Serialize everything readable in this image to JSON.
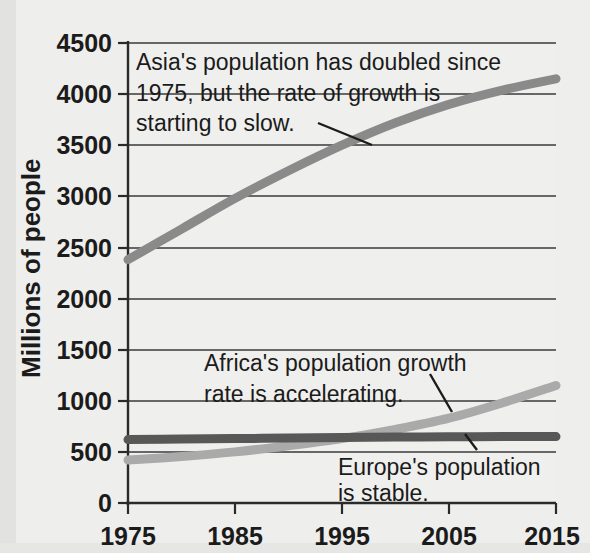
{
  "chart_data": {
    "type": "line",
    "title": "",
    "subtitle": "",
    "xlabel": "",
    "ylabel": "Millions of people",
    "x": [
      1975,
      1980,
      1985,
      1990,
      1995,
      2000,
      2005,
      2010,
      2015
    ],
    "xlim": [
      1975,
      2015
    ],
    "ylim": [
      0,
      4500
    ],
    "grid": true,
    "legend_position": "none",
    "x_tick_labels": [
      "1975",
      "1985",
      "1995",
      "2005",
      "2015"
    ],
    "x_tick_values": [
      1975,
      1985,
      1995,
      2005,
      2015
    ],
    "y_tick_labels": [
      "0",
      "500",
      "1000",
      "1500",
      "2000",
      "2500",
      "3000",
      "3500",
      "4000",
      "4500"
    ],
    "y_tick_values": [
      0,
      500,
      1000,
      1500,
      2000,
      2500,
      3000,
      3500,
      4000,
      4500
    ],
    "series": [
      {
        "name": "Asia",
        "color": "#8a8a8a",
        "line_width": 9,
        "values": [
          2380,
          2680,
          2980,
          3250,
          3500,
          3720,
          3900,
          4040,
          4150
        ]
      },
      {
        "name": "Africa",
        "color": "#aaaaaa",
        "line_width": 9,
        "values": [
          420,
          455,
          500,
          560,
          630,
          720,
          830,
          980,
          1150
        ]
      },
      {
        "name": "Europe",
        "color": "#585858",
        "line_width": 9,
        "values": [
          620,
          625,
          630,
          635,
          640,
          645,
          648,
          650,
          650
        ]
      }
    ],
    "annotations": [
      {
        "id": "asia-note",
        "lines": [
          "Asia's population has doubled since",
          "1975, but the rate of growth is",
          "starting to slow."
        ],
        "points_to_series": "Asia"
      },
      {
        "id": "africa-note",
        "lines": [
          "Africa's population growth",
          "rate is accelerating."
        ],
        "points_to_series": "Africa"
      },
      {
        "id": "europe-note",
        "lines": [
          "Europe's population",
          "is stable."
        ],
        "points_to_series": "Europe"
      }
    ]
  },
  "axes": {
    "y_title": "Millions of people",
    "y_ticks": [
      "4500",
      "4000",
      "3500",
      "3000",
      "2500",
      "2000",
      "1500",
      "1000",
      "500",
      "0"
    ],
    "x_ticks": [
      "1975",
      "1985",
      "1995",
      "2005",
      "2015"
    ]
  },
  "annotations": {
    "asia": {
      "line1": "Asia's population has doubled since",
      "line2": "1975, but the rate of growth is",
      "line3": "starting to slow."
    },
    "africa": {
      "line1": "Africa's population growth",
      "line2": "rate is accelerating."
    },
    "europe": {
      "line1": "Europe's population",
      "line2": "is stable."
    }
  },
  "colors": {
    "asia_line": "#8a8a8a",
    "africa_line": "#aaaaaa",
    "europe_line": "#585858",
    "grid": "#3a3a3a",
    "text": "#1b1b1b",
    "background": "#eeeeec"
  }
}
